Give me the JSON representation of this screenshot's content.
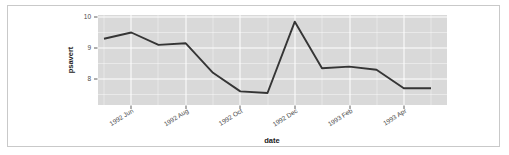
{
  "chart_data": {
    "type": "line",
    "title": "",
    "xlabel": "date",
    "ylabel": "psavert",
    "x_tick_labels": [
      "1992 Jun",
      "1992 Aug",
      "1992 Oct",
      "1992 Dec",
      "1993 Feb",
      "1993 Apr"
    ],
    "y_tick_labels": [
      "10",
      "9",
      "8"
    ],
    "y_tick_values": [
      10,
      9,
      8
    ],
    "ylim": [
      7.35,
      10.1
    ],
    "grid": true,
    "legend": null,
    "series": [
      {
        "name": "psavert",
        "x": [
          "1992 May",
          "1992 Jun",
          "1992 Jul",
          "1992 Aug",
          "1992 Sep",
          "1992 Oct",
          "1992 Nov",
          "1992 Dec",
          "1993 Jan",
          "1993 Feb",
          "1993 Mar",
          "1993 Apr"
        ],
        "values": [
          9.3,
          9.5,
          9.1,
          9.15,
          8.2,
          7.6,
          7.55,
          9.85,
          8.35,
          8.4,
          8.3,
          7.7
        ]
      }
    ],
    "line_color": "#353535",
    "panel_color": "#d9d9d9",
    "grid_color": "#ffffff"
  },
  "axis": {
    "x_title": "date",
    "y_title": "psavert"
  }
}
